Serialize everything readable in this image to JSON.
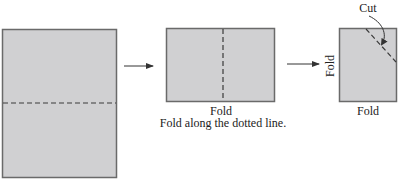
{
  "diagram": {
    "colors": {
      "paper_fill": "#d0d0d2",
      "paper_stroke": "#6a6a6a",
      "fold_line": "#3a3a3a",
      "arrow": "#333333",
      "text": "#222222"
    },
    "steps": [
      {
        "name": "unfolded-sheet",
        "fold_direction": "horizontal"
      },
      {
        "name": "folded-once",
        "fold_direction": "vertical",
        "label": "Fold",
        "caption": "Fold along the dotted line."
      },
      {
        "name": "folded-twice",
        "side_label": "Fold",
        "bottom_label": "Fold",
        "cut_label": "Cut"
      }
    ]
  }
}
